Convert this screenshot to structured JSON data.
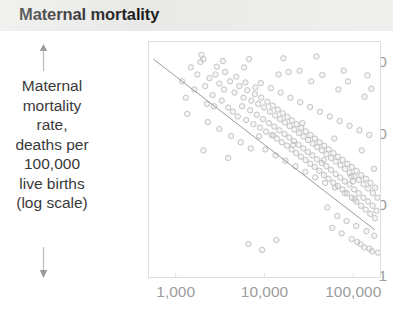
{
  "header": {
    "title": "Maternal mortality"
  },
  "axis_label": {
    "lines": [
      "Maternal",
      "mortality",
      "rate,",
      "deaths per",
      "100,000",
      "live births",
      "(log scale)"
    ],
    "arrow_up": "arrow-up-icon",
    "arrow_down": "arrow-down-icon"
  },
  "colors": {
    "title_band": "#e9e9e7",
    "title_text": "#1b1b1b",
    "axis_label_text": "#3a3a3a",
    "tick_text": "#9d9d9d",
    "plot_border": "#dedede",
    "marker_stroke": "#b9b9b9",
    "trend_line": "#8f8f8f",
    "arrow": "#9a9a9a"
  },
  "chart_data": {
    "type": "scatter",
    "title": "Maternal mortality",
    "xlabel": "",
    "ylabel": "Maternal mortality rate, deaths per 100,000 live births (log scale)",
    "xscale": "log",
    "yscale": "log",
    "xlim": [
      500,
      200000
    ],
    "ylim": [
      1,
      2000
    ],
    "grid": false,
    "legend": null,
    "xticks": [
      "1,000",
      "10,000",
      "100,000"
    ],
    "xtick_values": [
      1000,
      10000,
      100000
    ],
    "yticks": [
      "1,000",
      "100",
      "10",
      "1"
    ],
    "ytick_values": [
      1000,
      100,
      10,
      1
    ],
    "marker": "open-circle",
    "trend_line": {
      "type": "linear-fit-loglog",
      "x_start": 560,
      "y_start": 1150,
      "x_end": 175000,
      "y_end": 4.6
    },
    "points": [
      [
        1480,
        880
      ],
      [
        1750,
        700
      ],
      [
        1180,
        560
      ],
      [
        2050,
        1150
      ],
      [
        1620,
        430
      ],
      [
        2400,
        620
      ],
      [
        2150,
        480
      ],
      [
        1300,
        330
      ],
      [
        2800,
        700
      ],
      [
        3100,
        520
      ],
      [
        2600,
        360
      ],
      [
        3500,
        430
      ],
      [
        2250,
        270
      ],
      [
        4100,
        560
      ],
      [
        3300,
        300
      ],
      [
        4600,
        390
      ],
      [
        3900,
        240
      ],
      [
        5200,
        480
      ],
      [
        4400,
        210
      ],
      [
        5800,
        330
      ],
      [
        5000,
        180
      ],
      [
        6400,
        420
      ],
      [
        5600,
        250
      ],
      [
        7100,
        300
      ],
      [
        6200,
        160
      ],
      [
        7800,
        370
      ],
      [
        6900,
        220
      ],
      [
        8500,
        270
      ],
      [
        7500,
        140
      ],
      [
        9200,
        330
      ],
      [
        8200,
        190
      ],
      [
        9900,
        240
      ],
      [
        8900,
        125
      ],
      [
        10800,
        290
      ],
      [
        9600,
        165
      ],
      [
        11500,
        210
      ],
      [
        10400,
        110
      ],
      [
        12400,
        255
      ],
      [
        11200,
        145
      ],
      [
        13200,
        185
      ],
      [
        12000,
        98
      ],
      [
        14100,
        225
      ],
      [
        12900,
        130
      ],
      [
        15000,
        165
      ],
      [
        13800,
        88
      ],
      [
        16000,
        200
      ],
      [
        14700,
        115
      ],
      [
        17000,
        148
      ],
      [
        15700,
        78
      ],
      [
        18100,
        178
      ],
      [
        16800,
        102
      ],
      [
        19200,
        132
      ],
      [
        17900,
        70
      ],
      [
        20400,
        158
      ],
      [
        19000,
        91
      ],
      [
        21700,
        118
      ],
      [
        20200,
        62
      ],
      [
        23000,
        140
      ],
      [
        21500,
        81
      ],
      [
        24400,
        105
      ],
      [
        22800,
        55
      ],
      [
        25900,
        125
      ],
      [
        24200,
        72
      ],
      [
        27500,
        94
      ],
      [
        25700,
        49
      ],
      [
        29200,
        111
      ],
      [
        27300,
        64
      ],
      [
        31000,
        84
      ],
      [
        29000,
        44
      ],
      [
        32900,
        99
      ],
      [
        30800,
        57
      ],
      [
        34900,
        75
      ],
      [
        32700,
        39
      ],
      [
        37000,
        88
      ],
      [
        34700,
        51
      ],
      [
        39300,
        67
      ],
      [
        36800,
        35
      ],
      [
        41700,
        78
      ],
      [
        39100,
        45
      ],
      [
        44300,
        60
      ],
      [
        41500,
        31
      ],
      [
        47000,
        70
      ],
      [
        44100,
        40
      ],
      [
        49900,
        53
      ],
      [
        46800,
        27
      ],
      [
        53000,
        62
      ],
      [
        49700,
        36
      ],
      [
        56300,
        47
      ],
      [
        52800,
        24
      ],
      [
        59800,
        55
      ],
      [
        56100,
        32
      ],
      [
        63500,
        42
      ],
      [
        59500,
        21
      ],
      [
        67400,
        49
      ],
      [
        63200,
        28
      ],
      [
        71600,
        37
      ],
      [
        67100,
        19
      ],
      [
        76000,
        44
      ],
      [
        71300,
        25
      ],
      [
        80700,
        33
      ],
      [
        75700,
        17
      ],
      [
        85700,
        39
      ],
      [
        80400,
        22
      ],
      [
        91000,
        29
      ],
      [
        85400,
        15
      ],
      [
        96600,
        35
      ],
      [
        90700,
        20
      ],
      [
        102600,
        26
      ],
      [
        96300,
        13
      ],
      [
        109000,
        31
      ],
      [
        102200,
        17
      ],
      [
        115800,
        23
      ],
      [
        108500,
        11.5
      ],
      [
        123000,
        27
      ],
      [
        115200,
        15
      ],
      [
        130600,
        20
      ],
      [
        122400,
        10
      ],
      [
        138700,
        24
      ],
      [
        130000,
        13
      ],
      [
        147300,
        17.5
      ],
      [
        138000,
        8.8
      ],
      [
        156400,
        21
      ],
      [
        146600,
        11.5
      ],
      [
        166100,
        15
      ],
      [
        155600,
        7.7
      ],
      [
        176400,
        18
      ],
      [
        165200,
        10
      ],
      [
        187300,
        13
      ],
      [
        175500,
        6.7
      ],
      [
        2900,
        900
      ],
      [
        3600,
        760
      ],
      [
        4800,
        650
      ],
      [
        6100,
        540
      ],
      [
        7900,
        460
      ],
      [
        2300,
        150
      ],
      [
        3100,
        120
      ],
      [
        4200,
        96
      ],
      [
        5400,
        78
      ],
      [
        7000,
        64
      ],
      [
        9100,
        530
      ],
      [
        11800,
        450
      ],
      [
        15200,
        390
      ],
      [
        19600,
        330
      ],
      [
        25300,
        285
      ],
      [
        10200,
        62
      ],
      [
        13300,
        51
      ],
      [
        17200,
        43
      ],
      [
        22300,
        36
      ],
      [
        28800,
        30
      ],
      [
        32600,
        245
      ],
      [
        42100,
        210
      ],
      [
        54400,
        180
      ],
      [
        70300,
        155
      ],
      [
        90800,
        133
      ],
      [
        37200,
        25
      ],
      [
        48100,
        21
      ],
      [
        62200,
        18
      ],
      [
        80300,
        15
      ],
      [
        103800,
        12.5
      ],
      [
        117300,
        115
      ],
      [
        151500,
        99
      ],
      [
        1900,
        1050
      ],
      [
        2700,
        250
      ],
      [
        5900,
        880
      ],
      [
        8700,
        95
      ],
      [
        14400,
        700
      ],
      [
        21000,
        72
      ],
      [
        33500,
        560
      ],
      [
        46500,
        44
      ],
      [
        68000,
        430
      ],
      [
        95000,
        26
      ],
      [
        134000,
        340
      ],
      [
        171000,
        33
      ],
      [
        1350,
        195
      ],
      [
        1950,
        1320
      ],
      [
        3400,
        1080
      ],
      [
        6700,
        1150
      ],
      [
        12600,
        98
      ],
      [
        18700,
        760
      ],
      [
        26700,
        145
      ],
      [
        44800,
        690
      ],
      [
        61000,
        88
      ],
      [
        87000,
        560
      ],
      [
        125000,
        60
      ],
      [
        160000,
        440
      ],
      [
        183000,
        8.5
      ],
      [
        51000,
        9.5
      ],
      [
        66000,
        7.2
      ],
      [
        84000,
        6.1
      ],
      [
        108000,
        5.2
      ],
      [
        140000,
        4.4
      ],
      [
        172000,
        3.8
      ],
      [
        58000,
        4.9
      ],
      [
        74000,
        4.1
      ],
      [
        96000,
        3.4
      ],
      [
        121000,
        2.9
      ],
      [
        152000,
        2.5
      ],
      [
        190000,
        2.2
      ],
      [
        111000,
        3.1
      ],
      [
        133000,
        2.6
      ],
      [
        163000,
        2.3
      ],
      [
        78000,
        790
      ],
      [
        99000,
        22
      ],
      [
        144000,
        680
      ],
      [
        38500,
        1250
      ],
      [
        24900,
        790
      ],
      [
        16300,
        1180
      ],
      [
        2050,
        60
      ],
      [
        3900,
        47
      ],
      [
        6600,
        2.9
      ],
      [
        9400,
        2.4
      ],
      [
        13600,
        3.3
      ]
    ]
  }
}
